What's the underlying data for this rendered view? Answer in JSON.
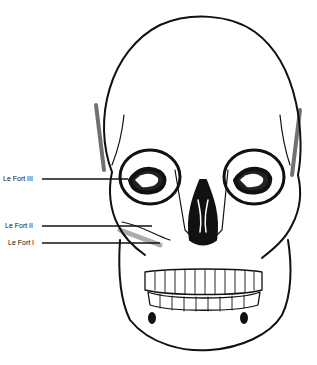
{
  "figure": {
    "labels": [
      {
        "text": "Le Fort III",
        "y": 179
      },
      {
        "text": "Le Fort II",
        "y": 226
      },
      {
        "text": "Le Fort I",
        "y": 243
      }
    ]
  }
}
